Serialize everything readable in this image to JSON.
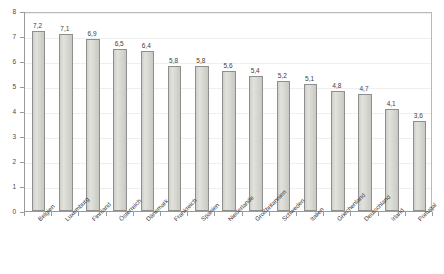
{
  "chart_data": {
    "type": "bar",
    "title": "",
    "subtitle": "",
    "xlabel": "",
    "ylabel": "",
    "ylim": [
      0,
      8
    ],
    "y_ticks": [
      "0",
      "1",
      "2",
      "3",
      "4",
      "5",
      "6",
      "7",
      "8"
    ],
    "grid": true,
    "legend": false,
    "decimal_separator": ",",
    "categories": [
      "Belgien",
      "Luxemburg",
      "Finnland",
      "Österreich",
      "Dänemark",
      "Frankreich",
      "Spanien",
      "Niederlande",
      "Großbritannien",
      "Schweden",
      "Italien",
      "Griechenland",
      "Deutschland",
      "Irland",
      "Portugal"
    ],
    "values": [
      7.2,
      7.1,
      6.9,
      6.5,
      6.4,
      5.8,
      5.8,
      5.6,
      5.4,
      5.2,
      5.1,
      4.8,
      4.7,
      4.1,
      3.6
    ],
    "value_labels": [
      "7,2",
      "7,1",
      "6,9",
      "6,5",
      "6,4",
      "5,8",
      "5,8",
      "5,6",
      "5,4",
      "5,2",
      "5,1",
      "4,8",
      "4,7",
      "4,1",
      "3,6"
    ],
    "colors": {
      "bar_fill": "#d6d6d1",
      "bar_border": "#8f8f8f",
      "axis": "#9a9a9a",
      "grid": "#f0efef",
      "text": "#3d3d3d",
      "plot_border": "#b9b9b9",
      "background": "#ffffff"
    }
  }
}
